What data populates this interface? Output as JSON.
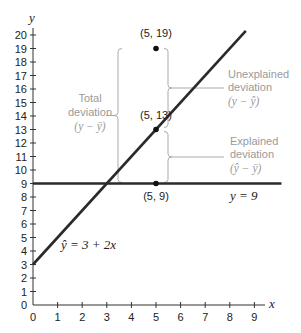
{
  "chart_data": {
    "type": "line",
    "title": "",
    "xlabel": "x",
    "ylabel": "y",
    "xlim": [
      0,
      9
    ],
    "ylim": [
      0,
      20
    ],
    "x_ticks": [
      0,
      1,
      2,
      3,
      4,
      5,
      6,
      7,
      8,
      9
    ],
    "y_ticks": [
      0,
      1,
      2,
      3,
      4,
      5,
      6,
      7,
      8,
      9,
      10,
      11,
      12,
      13,
      14,
      15,
      16,
      17,
      18,
      19,
      20
    ],
    "grid": false,
    "series": [
      {
        "name": "ŷ = 3 + 2x",
        "kind": "line",
        "intercept": 3,
        "slope": 2,
        "x": [
          0,
          8.65
        ],
        "y": [
          3,
          20.3
        ]
      },
      {
        "name": "y = 9",
        "kind": "hline",
        "y_value": 9,
        "x": [
          0,
          10.1
        ]
      }
    ],
    "points": [
      {
        "x": 5,
        "y": 19,
        "label": "(5, 19)"
      },
      {
        "x": 5,
        "y": 13,
        "label": "(5, 13)"
      },
      {
        "x": 5,
        "y": 9,
        "label": "(5, 9)"
      }
    ],
    "annotations": [
      {
        "id": "total",
        "line1": "Total",
        "line2": "deviation",
        "math": "(y − ȳ)",
        "span": [
          9,
          19
        ]
      },
      {
        "id": "unexplained",
        "line1": "Unexplained",
        "line2": "deviation",
        "math": "(y − ŷ)",
        "span": [
          13,
          19
        ]
      },
      {
        "id": "explained",
        "line1": "Explained",
        "line2": "deviation",
        "math": "(ŷ − ȳ)",
        "span": [
          9,
          13
        ]
      }
    ],
    "line_labels": {
      "regression": "ŷ = 3 + 2x",
      "mean": "y = 9"
    }
  }
}
